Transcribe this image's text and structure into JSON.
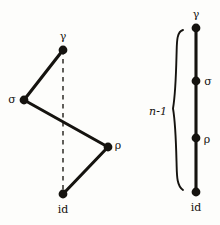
{
  "figure": {
    "background_color": "#fdfdfb",
    "ink_color": "#15130f",
    "width": 220,
    "height": 225
  },
  "left_diagram": {
    "name": "zigzag-path",
    "vertices": [
      {
        "id": "gamma",
        "label": "γ",
        "x": 63,
        "y": 50,
        "label_x": 63,
        "label_y": 36
      },
      {
        "id": "sigma",
        "label": "σ",
        "x": 24,
        "y": 100,
        "label_x": 12,
        "label_y": 99
      },
      {
        "id": "rho",
        "label": "ρ",
        "x": 108,
        "y": 147,
        "label_x": 118,
        "label_y": 145
      },
      {
        "id": "id",
        "label": "id",
        "x": 63,
        "y": 194,
        "label_x": 63,
        "label_y": 209
      }
    ],
    "solid_edges": [
      {
        "from": "gamma",
        "to": "sigma"
      },
      {
        "from": "sigma",
        "to": "rho"
      },
      {
        "from": "rho",
        "to": "id"
      }
    ],
    "dashed_edges": [
      {
        "from": "gamma",
        "to": "id"
      }
    ]
  },
  "right_diagram": {
    "name": "chain-path",
    "axis_x": 196,
    "vertices": [
      {
        "id": "gamma",
        "label": "γ",
        "x": 196,
        "y": 28,
        "label_x": 196,
        "label_y": 14
      },
      {
        "id": "sigma",
        "label": "σ",
        "x": 196,
        "y": 81,
        "label_x": 208,
        "label_y": 81
      },
      {
        "id": "rho",
        "label": "ρ",
        "x": 196,
        "y": 138,
        "label_x": 207,
        "label_y": 139
      },
      {
        "id": "id",
        "label": "id",
        "x": 196,
        "y": 192,
        "label_x": 196,
        "label_y": 207
      }
    ],
    "solid_edges": [
      {
        "from": "gamma",
        "to": "sigma"
      },
      {
        "from": "sigma",
        "to": "rho"
      },
      {
        "from": "rho",
        "to": "id"
      }
    ],
    "brace": {
      "label": "n-1",
      "label_x": 158,
      "label_y": 111,
      "top_y": 30,
      "bottom_y": 190,
      "tip_x": 172,
      "arm_x": 182
    }
  }
}
